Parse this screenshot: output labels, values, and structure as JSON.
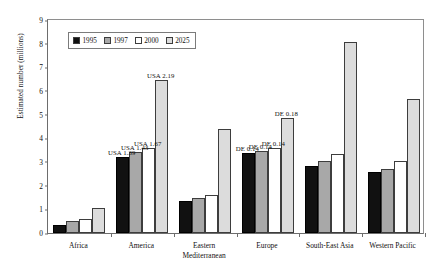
{
  "chart_data": {
    "type": "bar",
    "title": "",
    "xlabel": "",
    "ylabel": "Estimated number (millions)",
    "ylim": [
      0,
      9
    ],
    "yticks": [
      9,
      8,
      7,
      6,
      5,
      4,
      3,
      2,
      1,
      0
    ],
    "grid": false,
    "legend_position": "top-left inside plot",
    "categories": [
      "Africa",
      "America",
      "Eastern\nMediterranean",
      "Europe",
      "South-East Asia",
      "Western Pacific"
    ],
    "series": [
      {
        "name": "1995",
        "color": "#111111",
        "values": [
          0.35,
          3.2,
          1.35,
          3.35,
          2.8,
          2.55
        ]
      },
      {
        "name": "1997",
        "color": "#a8a8a8",
        "values": [
          0.5,
          3.4,
          1.45,
          3.45,
          3.0,
          2.7
        ]
      },
      {
        "name": "2000",
        "color": "#ffffff",
        "values": [
          0.6,
          3.55,
          1.6,
          3.55,
          3.3,
          3.0
        ]
      },
      {
        "name": "2025",
        "color": "#dcdcdc",
        "values": [
          1.05,
          6.4,
          4.35,
          4.8,
          8.0,
          5.6
        ]
      }
    ],
    "annotations": [
      {
        "text": "USA 1.39",
        "category": "America",
        "series": "1995",
        "value": 3.2
      },
      {
        "text": "USA 1.43",
        "category": "America",
        "series": "1997",
        "value": 3.4
      },
      {
        "text": "USA 1.67",
        "category": "America",
        "series": "2000",
        "value": 3.55
      },
      {
        "text": "USA 2.19",
        "category": "America",
        "series": "2025",
        "value": 6.4
      },
      {
        "text": "DE 0.14",
        "category": "Europe",
        "series": "1995",
        "value": 3.35
      },
      {
        "text": "DE 0.14",
        "category": "Europe",
        "series": "1997",
        "value": 3.45
      },
      {
        "text": "DE 0.14",
        "category": "Europe",
        "series": "2000",
        "value": 3.55
      },
      {
        "text": "DE 0.18",
        "category": "Europe",
        "series": "2025",
        "value": 4.8
      }
    ]
  },
  "ytick_labels": {
    "t9": "9",
    "t8": "8",
    "t7": "7",
    "t6": "6",
    "t5": "5",
    "t4": "4",
    "t3": "3",
    "t2": "2",
    "t1": "1",
    "t0": "0"
  },
  "axis": {
    "ylabel": "Estimated number (millions)"
  },
  "legend": {
    "items": [
      {
        "label": "1995"
      },
      {
        "label": "1997"
      },
      {
        "label": "2000"
      },
      {
        "label": "2025"
      }
    ]
  },
  "xlabels": [
    {
      "line1": "Africa",
      "line2": ""
    },
    {
      "line1": "America",
      "line2": ""
    },
    {
      "line1": "Eastern",
      "line2": "Mediterranean"
    },
    {
      "line1": "Europe",
      "line2": ""
    },
    {
      "line1": "South-East Asia",
      "line2": ""
    },
    {
      "line1": "Western Pacific",
      "line2": ""
    }
  ],
  "annotation_labels": {
    "a0": "USA 1.39",
    "a1": "USA 1.43",
    "a2": "USA 1.67",
    "a3": "USA 2.19",
    "a4": "DE 0.14",
    "a5": "DE 0.14",
    "a6": "DE 0.14",
    "a7": "DE 0.18"
  }
}
